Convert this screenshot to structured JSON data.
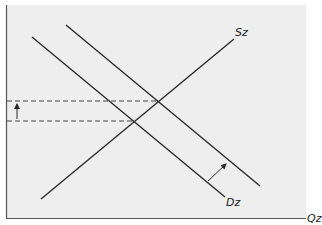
{
  "diagram": {
    "type": "supply-demand",
    "background_color": "#eeeeee",
    "line_color": "#2b2b2b",
    "labels": {
      "supply": "Sz",
      "demand": "Dz",
      "x_axis": "Qz"
    },
    "curves": [
      {
        "name": "supply",
        "label": "Sz",
        "from": [
          41,
          199
        ],
        "to": [
          234,
          39
        ]
      },
      {
        "name": "demand-initial",
        "label": "Dz",
        "from": [
          32,
          37
        ],
        "to": [
          225,
          197
        ]
      },
      {
        "name": "demand-shifted",
        "label": "",
        "from": [
          66,
          25
        ],
        "to": [
          260,
          186
        ]
      }
    ],
    "equilibria": [
      {
        "name": "initial",
        "point": [
          133,
          121
        ]
      },
      {
        "name": "new",
        "point": [
          156,
          101
        ]
      }
    ],
    "annotations": [
      {
        "name": "price-increase-arrow",
        "direction": "up"
      },
      {
        "name": "demand-shift-arrow",
        "direction": "up-right"
      }
    ]
  }
}
